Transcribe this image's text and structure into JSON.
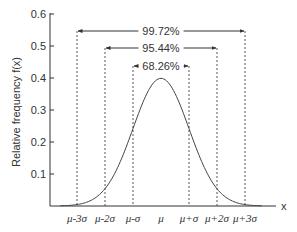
{
  "chart_data": {
    "type": "line",
    "title": "",
    "xlabel": "x",
    "ylabel": "Relative frequency f(x)",
    "ylim": [
      0,
      0.6
    ],
    "yticks": [
      "0.1",
      "0.2",
      "0.3",
      "0.4",
      "0.5",
      "0.6"
    ],
    "xticks": [
      "μ-3σ",
      "μ-2σ",
      "μ-σ",
      "μ",
      "μ+σ",
      "μ+2σ",
      "μ+3σ"
    ],
    "grid": false,
    "series": [
      {
        "name": "Normal distribution",
        "x": [
          -3,
          -2.5,
          -2,
          -1.5,
          -1,
          -0.5,
          0,
          0.5,
          1,
          1.5,
          2,
          2.5,
          3
        ],
        "values": [
          0.004,
          0.018,
          0.054,
          0.13,
          0.242,
          0.352,
          0.399,
          0.352,
          0.242,
          0.13,
          0.054,
          0.018,
          0.004
        ]
      }
    ],
    "annotations": [
      {
        "label": "68.26%",
        "from": "μ-σ",
        "to": "μ+σ"
      },
      {
        "label": "95.44%",
        "from": "μ-2σ",
        "to": "μ+2σ"
      },
      {
        "label": "99.72%",
        "from": "μ-3σ",
        "to": "μ+3σ"
      }
    ]
  },
  "colors": {
    "axis": "#333333",
    "curve": "#444444",
    "dashed": "#555555"
  }
}
